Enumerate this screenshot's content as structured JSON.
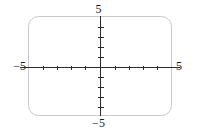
{
  "figure": {
    "kind": "coordinate-plane",
    "background_color": "#ffffff",
    "frame": {
      "shape": "rounded-rectangle",
      "stroke_color": "#c8c8c8",
      "stroke_width": 1,
      "corner_radius": 10,
      "x": 28,
      "y": 16,
      "width": 144,
      "height": 100
    },
    "axis_color": "#2b2b2b",
    "axis_width": 1,
    "tick_color": "#2b2b2b",
    "tick_width": 1
  },
  "labels": {
    "top": "5",
    "bottom": "−5",
    "left": "−5",
    "right": "5"
  },
  "chart_data": {
    "type": "line",
    "title": "",
    "subtitle": "",
    "xlabel": "",
    "ylabel": "",
    "xlim": [
      -5,
      5
    ],
    "ylim": [
      -5,
      5
    ],
    "grid": false,
    "legend": null,
    "series": [],
    "annotations": [],
    "xticks": [
      -4,
      -3,
      -2,
      -1,
      1,
      2,
      3,
      4
    ],
    "yticks": [
      -4,
      -3,
      -2,
      -1,
      1,
      2,
      3,
      4
    ],
    "xtick_labels": [
      "-5",
      "5"
    ],
    "ytick_labels": [
      "-5",
      "5"
    ],
    "tick_label_positions": {
      "x_min_label": "−5",
      "x_max_label": "5",
      "y_min_label": "−5",
      "y_max_label": "5"
    },
    "origin": {
      "x": 0,
      "y": 0
    },
    "axes_drawn": [
      "x-axis",
      "y-axis"
    ],
    "tick_mark_count_per_axis_side": 4,
    "x_axis_pixel_y": 67,
    "y_axis_pixel_x": 100
  },
  "geometry": {
    "x_axis": {
      "x1": 20,
      "y1": 67,
      "x2": 180,
      "y2": 67
    },
    "y_axis": {
      "x1": 100,
      "y1": 16,
      "x2": 100,
      "y2": 116
    },
    "x_tick_pixels": [
      43,
      57,
      71,
      85,
      115,
      129,
      143,
      157
    ],
    "y_tick_pixels": [
      27,
      37,
      47,
      57,
      77,
      87,
      97,
      107
    ],
    "x_tick_half_length": 2,
    "y_tick_half_length": 3
  }
}
